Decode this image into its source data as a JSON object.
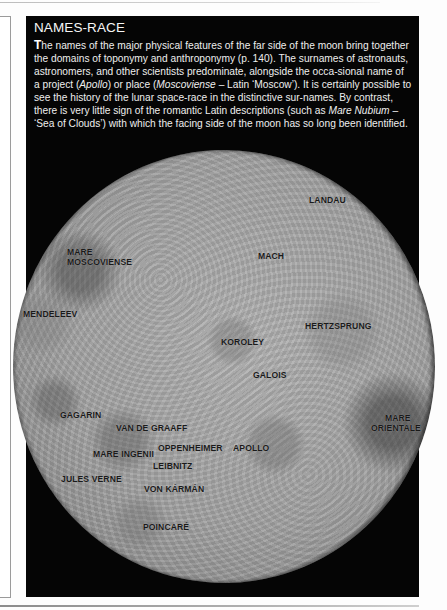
{
  "sidebar": {
    "title": "NAMES-RACE",
    "drop_cap": "T",
    "body": {
      "part1": "he names of the major physical features of the far side of the moon bring together the domains of toponymy and anthroponymy (p. 140). The surnames of astronauts, astronomers, and other scientists predominate, alongside the occa-sional name of a project (",
      "italic1": "Apollo",
      "part2": ") or place (",
      "italic2": "Moscoviense",
      "part3": " – Latin ‘Moscow’). It is certainly possible to see the history of the lunar space-race in the distinctive sur-names. By contrast, there is very little sign of the romantic Latin descriptions (such as ",
      "italic3": "Mare Nubium",
      "part4": " – ‘Sea of Clouds’) with which the facing side of the moon has so long been identified."
    }
  },
  "moon_map": {
    "image": "far-side-of-moon",
    "labels": [
      {
        "text": "LANDAU",
        "x": 309,
        "y": 195
      },
      {
        "text": "MARE",
        "x": 67,
        "y": 247
      },
      {
        "text": "MOSCOVIENSE",
        "x": 67,
        "y": 257
      },
      {
        "text": "MACH",
        "x": 258,
        "y": 251
      },
      {
        "text": "MENDELEEV",
        "x": 23,
        "y": 309
      },
      {
        "text": "HERTZSPRUNG",
        "x": 305,
        "y": 321
      },
      {
        "text": "KOROLEY",
        "x": 221,
        "y": 337
      },
      {
        "text": "GALOIS",
        "x": 253,
        "y": 370
      },
      {
        "text": "GAGARIN",
        "x": 60,
        "y": 410
      },
      {
        "text": "MARE",
        "x": 385,
        "y": 413
      },
      {
        "text": "ORIENTALE",
        "x": 371,
        "y": 423
      },
      {
        "text": "VAN DE GRAAFF",
        "x": 116,
        "y": 423
      },
      {
        "text": "OPPENHEIMER",
        "x": 158,
        "y": 443
      },
      {
        "text": "APOLLO",
        "x": 233,
        "y": 443
      },
      {
        "text": "MARE INGENII",
        "x": 93,
        "y": 449
      },
      {
        "text": "LEIBNITZ",
        "x": 153,
        "y": 461
      },
      {
        "text": "JULES VERNE",
        "x": 61,
        "y": 474
      },
      {
        "text": "VON KÁRMÁN",
        "x": 144,
        "y": 484
      },
      {
        "text": "POINCARÉ",
        "x": 143,
        "y": 522
      }
    ]
  }
}
